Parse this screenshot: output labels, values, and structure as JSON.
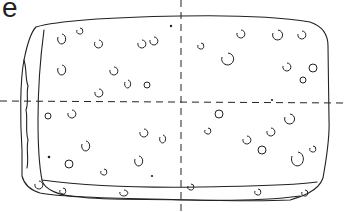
{
  "figure": {
    "corner_text": "e",
    "stroke_color": "#222222",
    "background": "#ffffff"
  }
}
